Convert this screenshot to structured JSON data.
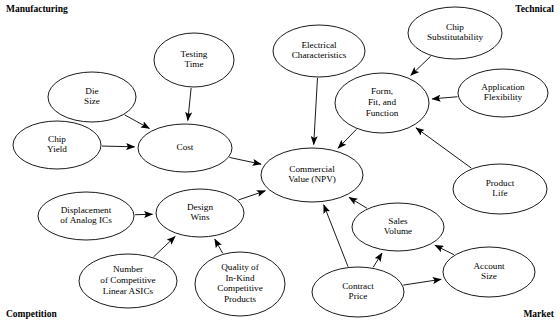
{
  "diagram": {
    "type": "influence-diagram",
    "corner_labels": {
      "top_left": "Manufacturing",
      "top_right": "Technical",
      "bottom_left": "Competition",
      "bottom_right": "Market"
    },
    "nodes": [
      {
        "id": "die_size",
        "label": "Die\nSize",
        "cx": 92,
        "cy": 97,
        "rx": 44,
        "ry": 25
      },
      {
        "id": "testing_time",
        "label": "Testing\nTime",
        "cx": 194,
        "cy": 60,
        "rx": 40,
        "ry": 27
      },
      {
        "id": "chip_yield",
        "label": "Chip\nYield",
        "cx": 57,
        "cy": 145,
        "rx": 44,
        "ry": 24
      },
      {
        "id": "cost",
        "label": "Cost",
        "cx": 185,
        "cy": 148,
        "rx": 47,
        "ry": 24
      },
      {
        "id": "electrical",
        "label": "Electrical\nCharacteristics",
        "cx": 319,
        "cy": 51,
        "rx": 46,
        "ry": 26
      },
      {
        "id": "chip_sub",
        "label": "Chip\nSubstitutability",
        "cx": 455,
        "cy": 33,
        "rx": 47,
        "ry": 26
      },
      {
        "id": "app_flex",
        "label": "Application\nFlexibility",
        "cx": 503,
        "cy": 93,
        "rx": 45,
        "ry": 24
      },
      {
        "id": "form_fit",
        "label": "Form,\nFit, and\nFunction",
        "cx": 382,
        "cy": 103,
        "rx": 47,
        "ry": 30
      },
      {
        "id": "commercial",
        "label": "Commercial\nValue (NPV)",
        "cx": 312,
        "cy": 175,
        "rx": 51,
        "ry": 27
      },
      {
        "id": "product_life",
        "label": "Product\nLife",
        "cx": 500,
        "cy": 189,
        "rx": 47,
        "ry": 25
      },
      {
        "id": "design_wins",
        "label": "Design\nWins",
        "cx": 200,
        "cy": 213,
        "rx": 44,
        "ry": 24
      },
      {
        "id": "displacement",
        "label": "Displacement\nof Analog ICs",
        "cx": 86,
        "cy": 216,
        "rx": 48,
        "ry": 24
      },
      {
        "id": "num_competitive",
        "label": "Number\nof Competitive\nLinear ASICs",
        "cx": 128,
        "cy": 281,
        "rx": 49,
        "ry": 27
      },
      {
        "id": "quality_inkind",
        "label": "Quality of\nIn-Kind\nCompetitive\nProducts",
        "cx": 240,
        "cy": 284,
        "rx": 45,
        "ry": 32
      },
      {
        "id": "sales_volume",
        "label": "Sales\nVolume",
        "cx": 398,
        "cy": 227,
        "rx": 46,
        "ry": 24
      },
      {
        "id": "account_size",
        "label": "Account\nSize",
        "cx": 489,
        "cy": 272,
        "rx": 46,
        "ry": 25
      },
      {
        "id": "contract_price",
        "label": "Contract\nPrice",
        "cx": 358,
        "cy": 292,
        "rx": 46,
        "ry": 25
      }
    ],
    "edges": [
      {
        "from": "die_size",
        "to": "cost"
      },
      {
        "from": "testing_time",
        "to": "cost"
      },
      {
        "from": "chip_yield",
        "to": "cost"
      },
      {
        "from": "cost",
        "to": "commercial"
      },
      {
        "from": "electrical",
        "to": "commercial"
      },
      {
        "from": "chip_sub",
        "to": "form_fit"
      },
      {
        "from": "app_flex",
        "to": "form_fit"
      },
      {
        "from": "product_life",
        "to": "form_fit"
      },
      {
        "from": "form_fit",
        "to": "commercial"
      },
      {
        "from": "design_wins",
        "to": "commercial"
      },
      {
        "from": "displacement",
        "to": "design_wins"
      },
      {
        "from": "num_competitive",
        "to": "design_wins"
      },
      {
        "from": "quality_inkind",
        "to": "design_wins"
      },
      {
        "from": "sales_volume",
        "to": "commercial"
      },
      {
        "from": "contract_price",
        "to": "commercial"
      },
      {
        "from": "contract_price",
        "to": "sales_volume"
      },
      {
        "from": "contract_price",
        "to": "account_size"
      },
      {
        "from": "account_size",
        "to": "sales_volume"
      }
    ],
    "colors": {
      "stroke": "#000000",
      "fill": "#ffffff",
      "text": "#000000"
    }
  }
}
